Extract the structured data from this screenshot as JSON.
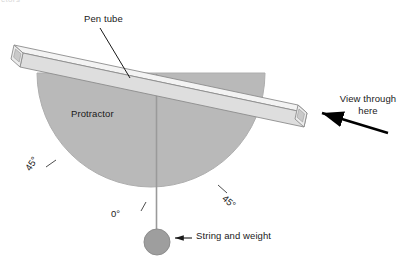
{
  "diagram": {
    "title_clipped": "ctors",
    "background_color": "#ffffff",
    "protractor": {
      "label": "Protractor",
      "fill_color": "#b9b9b9",
      "stroke_color": "#a8a8a8",
      "shape": "semicircle",
      "center_x": 151,
      "center_y": 73,
      "radius": 114
    },
    "pen_tube": {
      "label": "Pen tube",
      "fill_color": "#e2e2e2",
      "top_face_color": "#f2f2f2",
      "stroke_color": "#8c8c8c",
      "description": "rectangular tube lying across the top of the protractor, tilted downward to the right"
    },
    "string": {
      "label": "String and weight",
      "line_color": "#9a9a9a",
      "weight_fill": "#9e9e9e",
      "weight_stroke": "#8a8a8a",
      "weight_center_x": 157,
      "weight_center_y": 242,
      "weight_radius": 13
    },
    "view_arrow": {
      "label_line1": "View through",
      "label_line2": "here",
      "color": "#000000",
      "direction": "left"
    },
    "angle_marks": [
      {
        "name": "angle-left",
        "label": "45°",
        "value": 45,
        "unit": "degrees",
        "side": "left"
      },
      {
        "name": "angle-zero",
        "label": "0°",
        "value": 0,
        "unit": "degrees",
        "side": "bottom"
      },
      {
        "name": "angle-right",
        "label": "45°",
        "value": 45,
        "unit": "degrees",
        "side": "right"
      }
    ],
    "leader_lines": [
      {
        "name": "pen-tube-leader",
        "from": "Pen tube",
        "to": "pen tube body"
      },
      {
        "name": "string-weight-leader",
        "from": "String and weight",
        "to": "weight"
      },
      {
        "name": "view-through-leader",
        "from": "View through here",
        "to": "pen tube right opening"
      }
    ]
  }
}
